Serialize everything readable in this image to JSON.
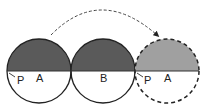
{
  "diagram": {
    "colors": {
      "dark_fill": "#5a5a5a",
      "light_fill": "#a0a0a0",
      "stroke": "#222222",
      "background": "#ffffff"
    },
    "circles": [
      {
        "id": "circle-a-start",
        "label": "A",
        "point_label": "P",
        "style": "solid",
        "top_fill": "dark"
      },
      {
        "id": "circle-b",
        "label": "B",
        "style": "solid",
        "top_fill": "dark"
      },
      {
        "id": "circle-a-end",
        "label": "A",
        "point_label": "P",
        "style": "dashed",
        "top_fill": "light"
      }
    ],
    "labels": {
      "a_start": "A",
      "p_start": "P",
      "b": "B",
      "a_end": "A",
      "p_end": "P"
    },
    "arrow": {
      "style": "dashed",
      "direction": "left-to-right arc over circle B"
    }
  }
}
